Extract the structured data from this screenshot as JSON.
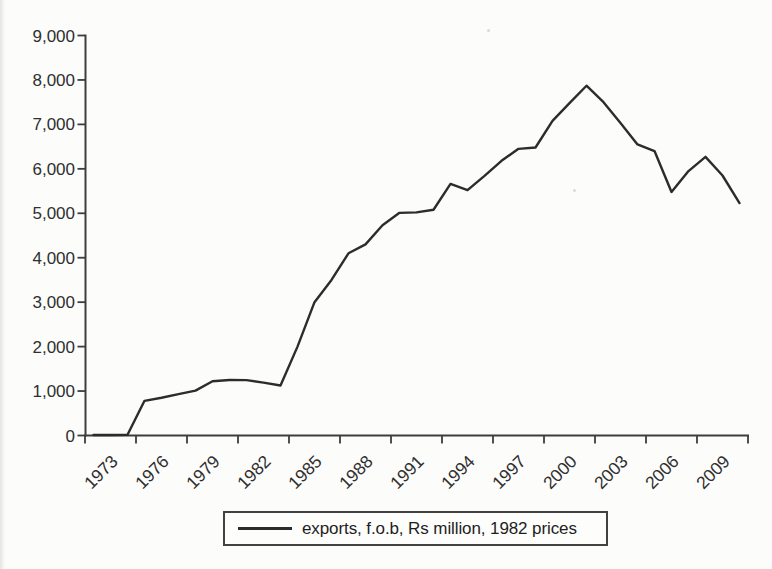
{
  "chart_data": {
    "type": "line",
    "title": "",
    "xlabel": "",
    "ylabel": "",
    "grid": false,
    "legend_position": "bottom",
    "background_color": "#fcfcfb",
    "axis_color": "#3d3d3d",
    "ylim": [
      0,
      9000
    ],
    "ytick_labels": [
      "0",
      "1,000",
      "2,000",
      "3,000",
      "4,000",
      "5,000",
      "6,000",
      "7,000",
      "8,000",
      "9,000"
    ],
    "xtick_labels": [
      "1973",
      "1976",
      "1979",
      "1982",
      "1985",
      "1988",
      "1991",
      "1994",
      "1997",
      "2000",
      "2003",
      "2006",
      "2009"
    ],
    "xtick_every": 3,
    "x": [
      1973,
      1974,
      1975,
      1976,
      1977,
      1978,
      1979,
      1980,
      1981,
      1982,
      1983,
      1984,
      1985,
      1986,
      1987,
      1988,
      1989,
      1990,
      1991,
      1992,
      1993,
      1994,
      1995,
      1996,
      1997,
      1998,
      1999,
      2000,
      2001,
      2002,
      2003,
      2004,
      2005,
      2006,
      2007,
      2008,
      2009,
      2010,
      2011
    ],
    "series": [
      {
        "name": "exports, f.o.b, Rs million, 1982 prices",
        "color": "#2c2c2c",
        "values": [
          10,
          10,
          15,
          780,
          850,
          930,
          1010,
          1220,
          1250,
          1245,
          1190,
          1125,
          2000,
          3000,
          3500,
          4100,
          4300,
          4730,
          5010,
          5020,
          5080,
          5660,
          5520,
          5840,
          6180,
          6450,
          6480,
          7080,
          7480,
          7870,
          7500,
          7030,
          6550,
          6400,
          5480,
          5950,
          6270,
          5850,
          5230
        ]
      }
    ]
  }
}
